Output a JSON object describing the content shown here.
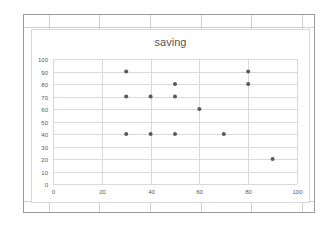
{
  "chart_data": {
    "type": "scatter",
    "title": "saving",
    "xlabel": "",
    "ylabel": "",
    "xlim": [
      0,
      100
    ],
    "ylim": [
      0,
      100
    ],
    "x_ticks": [
      0,
      20,
      40,
      60,
      80,
      100
    ],
    "y_ticks": [
      0,
      10,
      20,
      30,
      40,
      50,
      60,
      70,
      80,
      90,
      100
    ],
    "grid": true,
    "legend": "none",
    "series": [
      {
        "name": "saving",
        "color": "#595959",
        "points": [
          {
            "x": 30,
            "y": 90
          },
          {
            "x": 30,
            "y": 70
          },
          {
            "x": 30,
            "y": 40
          },
          {
            "x": 40,
            "y": 70
          },
          {
            "x": 40,
            "y": 40
          },
          {
            "x": 50,
            "y": 80
          },
          {
            "x": 50,
            "y": 70
          },
          {
            "x": 50,
            "y": 40
          },
          {
            "x": 60,
            "y": 60
          },
          {
            "x": 70,
            "y": 40
          },
          {
            "x": 80,
            "y": 90
          },
          {
            "x": 80,
            "y": 80
          },
          {
            "x": 90,
            "y": 20
          }
        ]
      }
    ]
  },
  "colors": {
    "gridline": "#d9d9d9",
    "marker": "#595959",
    "axis_text": "#595959"
  }
}
